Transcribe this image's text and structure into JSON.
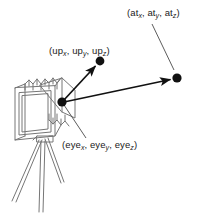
{
  "figure": {
    "background_color": "#ffffff",
    "line_color": "#6e6e6e",
    "dark_line_color": "#1a1a1a",
    "dot_color": "#111111",
    "width": 201,
    "height": 213
  },
  "labels": {
    "at": {
      "open": "(",
      "name1": "at",
      "sub1": "x",
      "sep1": ", ",
      "name2": "at",
      "sub2": "y",
      "sep2": ", ",
      "name3": "at",
      "sub3": "z",
      "close": ")",
      "full_text": "(atx, aty, atz)"
    },
    "up": {
      "open": "(",
      "name1": "up",
      "sub1": "x",
      "sep1": ", ",
      "name2": "up",
      "sub2": "y",
      "sep2": ", ",
      "name3": "up",
      "sub3": "z",
      "close": ")",
      "full_text": "(upx, upy, upz)"
    },
    "eye": {
      "open": "(",
      "name1": "eye",
      "sub1": "x",
      "sep1": ", ",
      "name2": "eye",
      "sub2": "y",
      "sep2": ", ",
      "name3": "eye",
      "sub3": "z",
      "close": ")",
      "full_text": "(eyex, eyey, eyez)"
    }
  },
  "points": {
    "eye": {
      "x": 62,
      "y": 102,
      "r": 4.6
    },
    "up": {
      "x": 100,
      "y": 61,
      "r": 4.4
    },
    "at": {
      "x": 177,
      "y": 78,
      "r": 4.6
    }
  },
  "vectors": {
    "up_vector": {
      "from": "eye",
      "to": "up",
      "arrow": true
    },
    "view_vector": {
      "from": "eye",
      "to": "at",
      "arrow": true
    }
  },
  "leaders": {
    "at_leader": {
      "x1": 152,
      "y1": 24,
      "x2": 174,
      "y2": 70
    },
    "eye_leader": {
      "x1": 64,
      "y1": 105,
      "x2": 85,
      "y2": 137
    }
  },
  "camera": {
    "description": "view camera with bellows on a tripod",
    "parts": [
      "front-standard-frame",
      "bellows",
      "rear-standard",
      "tripod-legs"
    ]
  }
}
